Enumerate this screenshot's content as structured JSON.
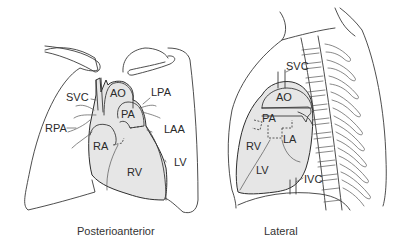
{
  "figure": {
    "panels": [
      {
        "id": "posterioanterior",
        "caption": "Posterioanterior",
        "labels": {
          "svc": "SVC",
          "ao": "AO",
          "lpa": "LPA",
          "pa": "PA",
          "rpa": "RPA",
          "laa": "LAA",
          "ra": "RA",
          "lv": "LV",
          "rv": "RV"
        }
      },
      {
        "id": "lateral",
        "caption": "Lateral",
        "labels": {
          "svc": "SVC",
          "ao": "AO",
          "pa": "PA",
          "la": "LA",
          "rv": "RV",
          "lv": "LV",
          "ivc": "IVC"
        }
      }
    ],
    "colors": {
      "heart_fill": "#e6e6e6",
      "outline": "#333333",
      "background": "#ffffff"
    }
  }
}
